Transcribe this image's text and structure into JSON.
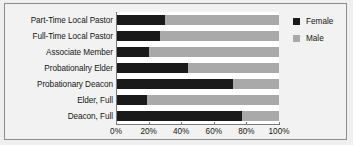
{
  "chart_data": {
    "type": "bar",
    "orientation": "horizontal",
    "stacked": true,
    "stacked_mode": "percent",
    "title": "",
    "xlabel": "",
    "ylabel": "",
    "xlim": [
      0,
      100
    ],
    "grid": false,
    "categories": [
      "Part-Time Local Pastor",
      "Full-Time Local Pastor",
      "Associate Member",
      "Probationalry Elder",
      "Probationary Deacon",
      "Elder, Full",
      "Deacon, Full"
    ],
    "x_tick_labels": [
      "0%",
      "20%",
      "40%",
      "60%",
      "80%",
      "100%"
    ],
    "x_tick_values": [
      0,
      20,
      40,
      60,
      80,
      100
    ],
    "series": [
      {
        "name": "Female",
        "color": "#1a1a1a",
        "values": [
          30,
          27,
          20,
          44,
          72,
          19,
          77
        ]
      },
      {
        "name": "Male",
        "color": "#a9a9a9",
        "values": [
          70,
          73,
          80,
          56,
          28,
          81,
          23
        ]
      }
    ],
    "legend": {
      "position": "right",
      "entries": [
        {
          "label": "Female",
          "color": "#1a1a1a",
          "swatch": "square-swatch-female"
        },
        {
          "label": "Male",
          "color": "#a9a9a9",
          "swatch": "square-swatch-male"
        }
      ]
    }
  },
  "colors": {
    "female": "#1a1a1a",
    "male": "#a9a9a9",
    "plot_background": "#ffffff",
    "chart_background": "#f2f2f2",
    "page_background": "#efefef",
    "axis": "#7a7a7a",
    "border": "#8c8c8c",
    "text": "#161616"
  }
}
